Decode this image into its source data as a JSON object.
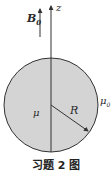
{
  "figure": {
    "caption": "习题 2 图",
    "labels": {
      "field": "B",
      "field_subscript": "0",
      "axis": "z",
      "sphere_permeability": "μ",
      "outer_permeability": "μ",
      "outer_subscript": "0",
      "radius": "R"
    },
    "colors": {
      "sphere_fill": "#d4d4d4",
      "stroke": "#333333",
      "background": "#ffffff"
    },
    "geometry": {
      "sphere_center": [
        51,
        105
      ],
      "sphere_radius": 47,
      "axis_x": 51,
      "field_arrow_x": 40
    }
  }
}
